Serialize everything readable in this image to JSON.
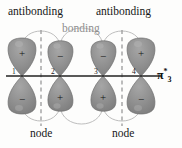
{
  "figure": {
    "orbital_label": "π",
    "orbital_star": "*",
    "orbital_subscript": "3"
  },
  "labels": {
    "antibonding_left": "antibonding",
    "antibonding_right": "antibonding",
    "bonding": "bonding",
    "node_left": "node",
    "node_right": "node"
  },
  "colors": {
    "lobe_fill": "#8c8c8c",
    "lobe_stroke": "#6f6f6f",
    "lobe_highlight": "#a8a8a8",
    "axis": "#222222",
    "node_line": "#9a9a9a",
    "arc": "#b5b5b5",
    "bonding_text": "#8f8f8f",
    "text": "#171717"
  },
  "axis": {
    "y": 76,
    "x_start": 6,
    "x_end": 162
  },
  "atoms": [
    {
      "index": "1",
      "x": 22,
      "top_sign": "+",
      "bottom_sign": "−"
    },
    {
      "index": "2",
      "x": 60,
      "top_sign": "−",
      "bottom_sign": "+"
    },
    {
      "index": "3",
      "x": 103,
      "top_sign": "−",
      "bottom_sign": "+"
    },
    {
      "index": "4",
      "x": 141,
      "top_sign": "+",
      "bottom_sign": "−"
    }
  ],
  "nodes": [
    {
      "id": "node-line-left",
      "x": 41,
      "y_top": 30,
      "y_bottom": 125
    },
    {
      "id": "node-line-right",
      "x": 122,
      "y_top": 30,
      "y_bottom": 125
    }
  ],
  "interactions": [
    {
      "id": "arc-1-2-top",
      "type": "antibonding"
    },
    {
      "id": "arc-2-3-top",
      "type": "bonding"
    },
    {
      "id": "arc-3-4-top",
      "type": "antibonding"
    },
    {
      "id": "arc-1-2-bottom",
      "type": "antibonding"
    },
    {
      "id": "arc-2-3-bottom",
      "type": "bonding"
    },
    {
      "id": "arc-3-4-bottom",
      "type": "antibonding"
    }
  ]
}
